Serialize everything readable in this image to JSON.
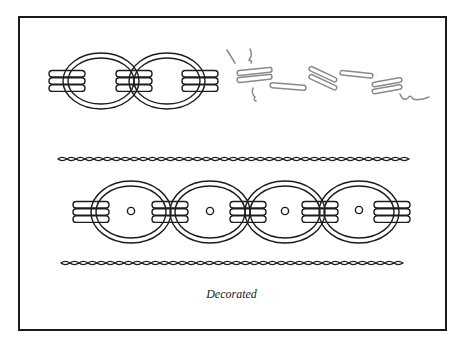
{
  "figure": {
    "caption": "Decorated",
    "colors": {
      "ink": "#1c1c1c",
      "faded_sketch": "#8a8a8a",
      "background": "#ffffff",
      "frame": "#1a1a1a"
    },
    "elements": [
      {
        "name": "top-chain",
        "description": "Two oval links joined by triple-banded collars",
        "links": 2,
        "collars": 3
      },
      {
        "name": "faded-sketch",
        "description": "Faint grey scattered band fragments to the right of the top chain"
      },
      {
        "name": "twisted-rope-upper",
        "description": "Long twisted cord line"
      },
      {
        "name": "decorated-chain",
        "description": "Four oval links with centered rivet dots joined by triple-banded collars",
        "links": 4,
        "collars": 5
      },
      {
        "name": "twisted-rope-lower",
        "description": "Long twisted cord line"
      }
    ]
  }
}
